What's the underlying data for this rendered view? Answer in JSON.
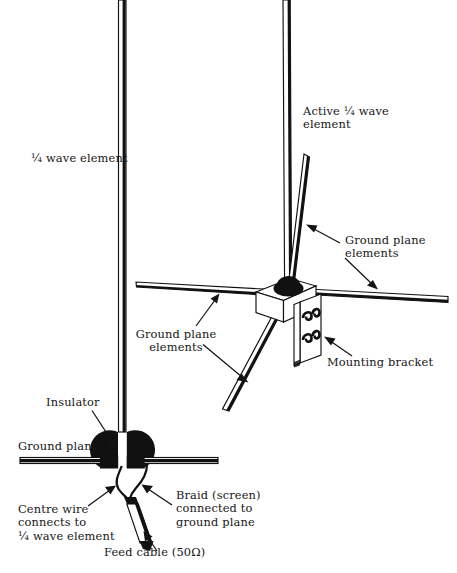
{
  "figure": {
    "ink_color": "#111111",
    "background_color": "#ffffff"
  },
  "labels": {
    "quarter_wave_element": "¼ wave element",
    "active_quarter_wave_element": "Active ¼ wave\nelement",
    "ground_plane_elements_right": "Ground plane\nelements",
    "ground_plane_elements_left": "Ground plane\nelements",
    "mounting_bracket": "Mounting bracket",
    "insulator": "Insulator",
    "ground_plane": "Ground plane",
    "centre_wire": "Centre wire\nconnects to\n¼ wave element",
    "braid_screen": "Braid (screen)\nconnected to\nground plane",
    "feed_cable": "Feed cable (50Ω)"
  },
  "parts": {
    "vertical_element": "¼ wave vertical radiator",
    "ground_plane_bar": "horizontal ground plane sheet",
    "insulator_block": "insulator half discs",
    "coax_cable": "50 ohm feed coaxial cable",
    "centre_conductor": "centre wire",
    "braid_conductor": "braid screen wire",
    "hub": "insulator dome on bracket",
    "bracket": "mounting bracket box",
    "u_bolt": "u-bolt clamp coil",
    "radial_up_right": "ground plane radial upper right",
    "radial_left": "ground plane radial left",
    "radial_right": "ground plane radial right",
    "radial_down_left": "ground plane radial lower left"
  }
}
